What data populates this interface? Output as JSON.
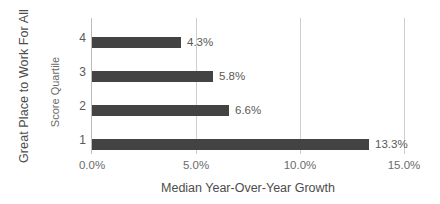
{
  "chart_data": {
    "type": "bar",
    "orientation": "horizontal",
    "title": "",
    "categories": [
      "4",
      "3",
      "2",
      "1"
    ],
    "values": [
      4.3,
      5.8,
      6.6,
      13.3
    ],
    "data_labels": [
      "4.3%",
      "5.8%",
      "6.6%",
      "13.3%"
    ],
    "xlabel": "Median Year-Over-Year Growth",
    "ylabel": "Score Quartile",
    "outer_ylabel": "Great Place to Work For All",
    "xlim": [
      0,
      15
    ],
    "xticks": [
      0,
      5,
      10,
      15
    ],
    "xtick_labels": [
      "0.0%",
      "5.0%",
      "10.0%",
      "15.0%"
    ],
    "grid": "vertical",
    "legend": "none",
    "colors": {
      "bar": "#434343",
      "gridline": "#cfcfcf",
      "axis": "#bdbdbd",
      "text": "#595959",
      "background": "#ffffff"
    }
  }
}
